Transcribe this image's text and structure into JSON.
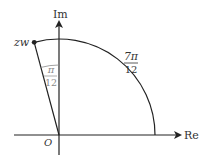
{
  "diagram": {
    "axes": {
      "x_label": "Re",
      "y_label": "Im",
      "origin_label": "O"
    },
    "point": {
      "label": "zw"
    },
    "arc_angle": {
      "numerator": "7π",
      "denominator": "12"
    },
    "small_angle": {
      "numerator": "π",
      "denominator": "12"
    },
    "colors": {
      "line": "#222222",
      "angle_label": "#8a8a8a"
    }
  }
}
